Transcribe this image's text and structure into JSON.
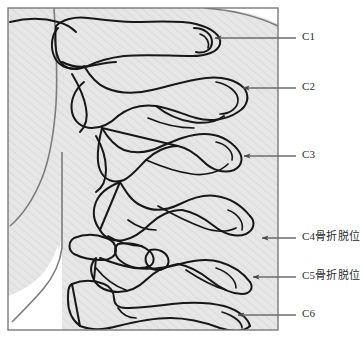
{
  "figure": {
    "frame": {
      "x": 8,
      "y": 8,
      "width": 270,
      "height": 322,
      "border_color": "#7a7a7a",
      "fill_color": "#e3e3e3",
      "hatch_color": "#cfcfcf"
    },
    "line_color": "#1a1a1a",
    "soft_tissue_fill": "#ffffff",
    "leader_color": "#6b6b6b",
    "arrow_color": "#4a4a4a"
  },
  "labels": [
    {
      "id": "c1",
      "text": "C1",
      "text_x": 302,
      "text_y": 36,
      "leader_x1": 215,
      "leader_y1": 38,
      "leader_x2": 296,
      "leader_y2": 38,
      "arrow_x": 215,
      "arrow_y": 38
    },
    {
      "id": "c2",
      "text": "C2",
      "text_x": 302,
      "text_y": 86,
      "leader_x1": 243,
      "leader_y1": 88,
      "leader_x2": 296,
      "leader_y2": 88,
      "arrow_x": 243,
      "arrow_y": 88
    },
    {
      "id": "c3",
      "text": "C3",
      "text_x": 302,
      "text_y": 154,
      "leader_x1": 244,
      "leader_y1": 156,
      "leader_x2": 296,
      "leader_y2": 156,
      "arrow_x": 244,
      "arrow_y": 156
    },
    {
      "id": "c4",
      "text": "C4骨折脱位",
      "text_x": 302,
      "text_y": 232,
      "leader_x1": 262,
      "leader_y1": 238,
      "leader_x2": 296,
      "leader_y2": 238,
      "arrow_x": 262,
      "arrow_y": 238
    },
    {
      "id": "c5",
      "text": "C5骨折脱位",
      "text_x": 302,
      "text_y": 271,
      "leader_x1": 253,
      "leader_y1": 277,
      "leader_x2": 296,
      "leader_y2": 277,
      "arrow_x": 253,
      "arrow_y": 277
    },
    {
      "id": "c6",
      "text": "C6",
      "text_x": 302,
      "text_y": 313,
      "leader_x1": 238,
      "leader_y1": 315,
      "leader_x2": 296,
      "leader_y2": 315,
      "arrow_x": 238,
      "arrow_y": 315
    }
  ]
}
